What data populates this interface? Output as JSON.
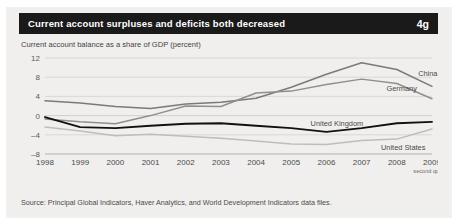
{
  "panel": {
    "title": "Current account surpluses and deficits both decreased",
    "badge": "4g",
    "subtitle": "Current account balance as a share of GDP (percent)",
    "source": "Source: Principal Global Indicators, Haver Analytics, and World Development Indicators data files."
  },
  "chart_data": {
    "type": "line",
    "title": "Current account surpluses and deficits both decreased",
    "subtitle": "Current account balance as a share of GDP (percent)",
    "xlabel": "",
    "ylabel": "",
    "categories": [
      "1998",
      "1999",
      "2000",
      "2001",
      "2002",
      "2003",
      "2004",
      "2005",
      "2006",
      "2007",
      "2008",
      "2009"
    ],
    "x_tick_note": "second quarter",
    "x_tick_note_for": "2009",
    "ylim": [
      -8,
      12
    ],
    "yticks": [
      12,
      8,
      4,
      0,
      -4,
      -8
    ],
    "grid": true,
    "legend": "inline-labels",
    "series": [
      {
        "name": "China",
        "color": "#7a7a7a",
        "values": [
          3.1,
          2.6,
          1.9,
          1.5,
          2.4,
          2.8,
          3.6,
          5.9,
          8.6,
          11.0,
          9.6,
          6.1
        ]
      },
      {
        "name": "Germany",
        "color": "#8f8f8f",
        "values": [
          -0.7,
          -1.3,
          -1.7,
          0.0,
          2.0,
          1.9,
          4.7,
          5.1,
          6.5,
          7.6,
          6.7,
          3.5
        ]
      },
      {
        "name": "United Kingdom",
        "color": "#111111",
        "values": [
          -0.3,
          -2.4,
          -2.6,
          -2.1,
          -1.7,
          -1.6,
          -2.1,
          -2.6,
          -3.4,
          -2.6,
          -1.6,
          -1.3
        ]
      },
      {
        "name": "United States",
        "color": "#bdbdbd",
        "values": [
          -2.4,
          -3.2,
          -4.2,
          -3.9,
          -4.3,
          -4.7,
          -5.3,
          -5.9,
          -6.0,
          -5.2,
          -4.9,
          -2.8
        ]
      }
    ]
  }
}
